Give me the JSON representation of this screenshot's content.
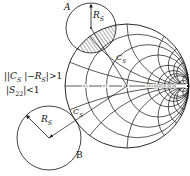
{
  "diagram": {
    "type": "smith-chart-stability-circles",
    "labels": {
      "point_a": "A",
      "point_b": "B",
      "radius_a": "R",
      "radius_a_sub": "S",
      "radius_b": "R",
      "radius_b_sub": "S",
      "center_a": "C",
      "center_a_sub": "S",
      "center_b": "C",
      "center_b_sub": "S"
    },
    "conditions": {
      "line1_prefix": "||",
      "line1_c": "C",
      "line1_c_sub": "S",
      "line1_mid": "|−",
      "line1_r": "R",
      "line1_r_sub": "S",
      "line1_suffix": "|>1",
      "line2_prefix": "|",
      "line2_s": "S",
      "line2_s_sub": "22",
      "line2_suffix": "|<1"
    },
    "smith_chart": {
      "resistance_labels": [
        "0.2",
        "0.5",
        "1.0",
        "2.0",
        "3.0",
        "4.0",
        "5.0",
        "10",
        "20"
      ]
    },
    "colors": {
      "stroke": "#111111",
      "background": "#ffffff"
    }
  }
}
